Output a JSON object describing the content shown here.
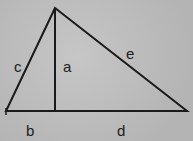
{
  "diagram": {
    "type": "right-triangle-altitude",
    "labels": {
      "altitude": "a",
      "left_base_segment": "b",
      "left_side": "c",
      "right_base_segment": "d",
      "right_side": "e"
    },
    "colors": {
      "background": "#bdbdbd",
      "line": "#1a1a1a"
    }
  }
}
